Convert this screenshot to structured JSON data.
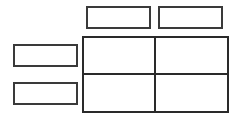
{
  "diagram": {
    "type": "2x2 matrix template",
    "line_color": "#2a2a2a",
    "column_headers": [
      {
        "label": ""
      },
      {
        "label": ""
      }
    ],
    "row_headers": [
      {
        "label": ""
      },
      {
        "label": ""
      }
    ],
    "cells": [
      [
        {
          "label": ""
        },
        {
          "label": ""
        }
      ],
      [
        {
          "label": ""
        },
        {
          "label": ""
        }
      ]
    ]
  }
}
